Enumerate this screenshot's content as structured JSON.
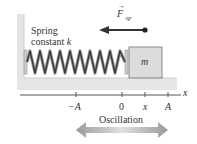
{
  "diagram": {
    "spring_label_line1": "Spring",
    "spring_label_line2": "constant ",
    "spring_constant_symbol": "k",
    "mass_label": "m",
    "force_symbol": "F",
    "force_subscript": "sp",
    "axis_label": "x",
    "ticks": [
      {
        "label": "−A",
        "x": 76
      },
      {
        "label": "0",
        "x": 122
      },
      {
        "label": "x",
        "x": 145
      },
      {
        "label": "A",
        "x": 168
      }
    ],
    "oscillation_label": "Oscillation",
    "colors": {
      "wall": "#e4e4e4",
      "floor": "#e6e6e6",
      "spring": "#444444",
      "mass_fill": "#dddddd",
      "mass_stroke": "#888888",
      "axis": "#555555",
      "force_arrow": "#333333",
      "oscillation_arrow": "#a0a0a0"
    }
  }
}
